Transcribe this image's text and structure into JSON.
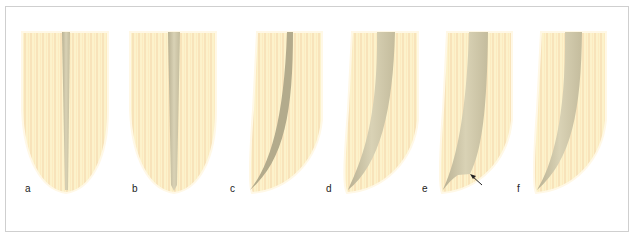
{
  "figure": {
    "panels": [
      {
        "label": "a",
        "description": "straight root canal, narrow"
      },
      {
        "label": "b",
        "description": "straight root canal, slightly wider apex"
      },
      {
        "label": "c",
        "description": "curved root canal, narrow"
      },
      {
        "label": "d",
        "description": "curved root canal, enlarged"
      },
      {
        "label": "e",
        "description": "curved root canal with ledge",
        "annotation": "arrow pointing to ledge"
      },
      {
        "label": "f",
        "description": "curved root canal, shaped"
      }
    ],
    "colors": {
      "dentin": "#fbefc4",
      "dentin_stripe": "#f6dcae",
      "canal": "#cfc7a8",
      "canal_dark": "#a9a283",
      "border": "#cfcfcf",
      "label": "#222222"
    }
  }
}
